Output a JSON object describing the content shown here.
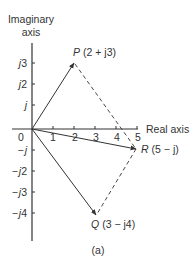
{
  "figure": {
    "caption": "(a)",
    "y_axis_label_line1": "Imaginary",
    "y_axis_label_line2": "axis",
    "x_axis_label": "Real axis",
    "origin_label": "0",
    "x_ticks": [
      "1",
      "2",
      "3",
      "4",
      "5"
    ],
    "y_ticks_positive": [
      {
        "pre": "j",
        "num": ""
      },
      {
        "pre": "j",
        "num": "2"
      },
      {
        "pre": "j",
        "num": "3"
      }
    ],
    "y_ticks_negative": [
      {
        "sign": "−",
        "pre": "j",
        "num": ""
      },
      {
        "sign": "−",
        "pre": "j",
        "num": "2"
      },
      {
        "sign": "−",
        "pre": "j",
        "num": "3"
      },
      {
        "sign": "−",
        "pre": "j",
        "num": "4"
      }
    ],
    "points": {
      "P": {
        "name": "P",
        "value": "(2 + j3)",
        "re": 2,
        "im": 3
      },
      "Q": {
        "name": "Q",
        "value": "(3 − j4)",
        "re": 3,
        "im": -4
      },
      "R": {
        "name": "R",
        "value": "(5 − j)",
        "re": 5,
        "im": -1
      }
    },
    "line_color": "#333333"
  }
}
